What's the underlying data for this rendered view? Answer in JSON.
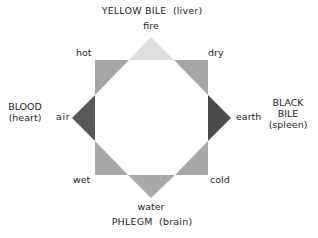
{
  "diagram": {
    "humors": {
      "top": {
        "name": "YELLOW BILE",
        "organ": "(liver)",
        "element": "fire"
      },
      "left": {
        "name": "BLOOD",
        "organ": "(heart)",
        "element": "air"
      },
      "right": {
        "name_line1": "BLACK",
        "name_line2": "BILE",
        "organ": "(spleen)",
        "element": "earth"
      },
      "bottom": {
        "name": "PHLEGM",
        "organ": "(brain)",
        "element": "water"
      }
    },
    "qualities": {
      "top_left": "hot",
      "top_right": "dry",
      "bottom_left": "wet",
      "bottom_right": "cold"
    },
    "colors": {
      "fire_triangle": "#dedede",
      "air_triangle": "#585858",
      "earth_triangle": "#4a4a4a",
      "water_triangle": "#a9a9a9",
      "corner_triangle": "#a6a6a6",
      "text": "#262626",
      "background": "#ffffff"
    }
  }
}
